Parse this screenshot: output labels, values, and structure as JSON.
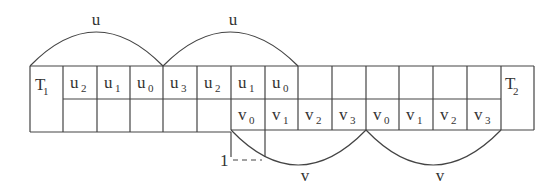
{
  "diagram": {
    "arcs_top": [
      {
        "label": "u",
        "x1": 30,
        "x2": 163
      },
      {
        "label": "u",
        "x1": 163,
        "x2": 298
      }
    ],
    "arcs_bottom": [
      {
        "label": "v",
        "x1": 231,
        "x2": 366
      },
      {
        "label": "v",
        "x1": 366,
        "x2": 501
      }
    ],
    "left_end": {
      "label": "T",
      "sub": "1"
    },
    "right_end": {
      "label": "T",
      "sub": "2"
    },
    "top_row": [
      {
        "base": "u",
        "sub": "2"
      },
      {
        "base": "u",
        "sub": "1"
      },
      {
        "base": "u",
        "sub": "0"
      },
      {
        "base": "u",
        "sub": "3"
      },
      {
        "base": "u",
        "sub": "2"
      },
      {
        "base": "u",
        "sub": "1"
      },
      {
        "base": "u",
        "sub": "0"
      },
      {
        "base": "",
        "sub": ""
      },
      {
        "base": "",
        "sub": ""
      },
      {
        "base": "",
        "sub": ""
      },
      {
        "base": "",
        "sub": ""
      },
      {
        "base": "",
        "sub": ""
      },
      {
        "base": "",
        "sub": ""
      }
    ],
    "bottom_row": [
      {
        "base": "",
        "sub": ""
      },
      {
        "base": "",
        "sub": ""
      },
      {
        "base": "",
        "sub": ""
      },
      {
        "base": "",
        "sub": ""
      },
      {
        "base": "",
        "sub": ""
      },
      {
        "base": "v",
        "sub": "0"
      },
      {
        "base": "v",
        "sub": "1"
      },
      {
        "base": "v",
        "sub": "2"
      },
      {
        "base": "v",
        "sub": "3"
      },
      {
        "base": "v",
        "sub": "0"
      },
      {
        "base": "v",
        "sub": "1"
      },
      {
        "base": "v",
        "sub": "2"
      },
      {
        "base": "v",
        "sub": "3"
      }
    ],
    "offset_marker": {
      "label": "1"
    }
  }
}
